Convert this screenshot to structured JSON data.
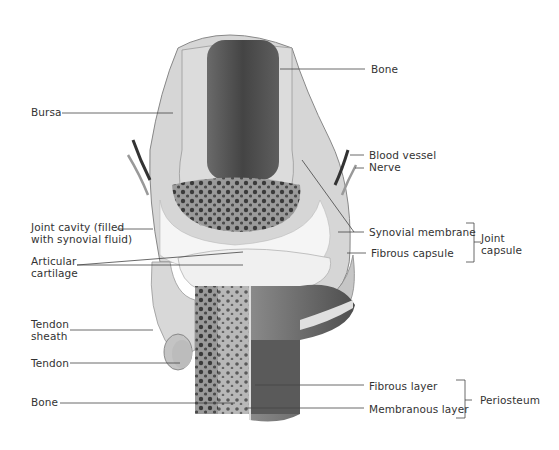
{
  "colors": {
    "background": "#ffffff",
    "label_text": "#333333",
    "leader_line": "#444444",
    "compact_bone": "#d4d4d4",
    "marrow": "#5a5a5a",
    "spongy_bone": "#8a8a8a",
    "cartilage": "#f2f2f2",
    "capsule": "#c8c8c8",
    "outer_shaft": "#6e6e6e"
  },
  "labels_left": [
    {
      "id": "bursa",
      "lines": [
        "Bursa"
      ]
    },
    {
      "id": "joint-cavity",
      "lines": [
        "Joint cavity (filled",
        "with synovial fluid)"
      ]
    },
    {
      "id": "articular-cartilage",
      "lines": [
        "Articular",
        "cartilage"
      ]
    },
    {
      "id": "tendon-sheath",
      "lines": [
        "Tendon",
        "sheath"
      ]
    },
    {
      "id": "tendon",
      "lines": [
        "Tendon"
      ]
    },
    {
      "id": "bone-lower",
      "lines": [
        "Bone"
      ]
    }
  ],
  "labels_right": [
    {
      "id": "bone-upper",
      "lines": [
        "Bone"
      ]
    },
    {
      "id": "blood-vessel",
      "lines": [
        "Blood vessel"
      ]
    },
    {
      "id": "nerve",
      "lines": [
        "Nerve"
      ]
    },
    {
      "id": "synovial-membrane",
      "lines": [
        "Synovial membrane"
      ]
    },
    {
      "id": "fibrous-capsule",
      "lines": [
        "Fibrous capsule"
      ]
    },
    {
      "id": "fibrous-layer",
      "lines": [
        "Fibrous layer"
      ]
    },
    {
      "id": "membranous-layer",
      "lines": [
        "Membranous layer"
      ]
    }
  ],
  "groups": [
    {
      "id": "joint-capsule",
      "lines": [
        "Joint",
        "capsule"
      ],
      "members": [
        "synovial-membrane",
        "fibrous-capsule"
      ]
    },
    {
      "id": "periosteum",
      "lines": [
        "Periosteum"
      ],
      "members": [
        "fibrous-layer",
        "membranous-layer"
      ]
    }
  ]
}
